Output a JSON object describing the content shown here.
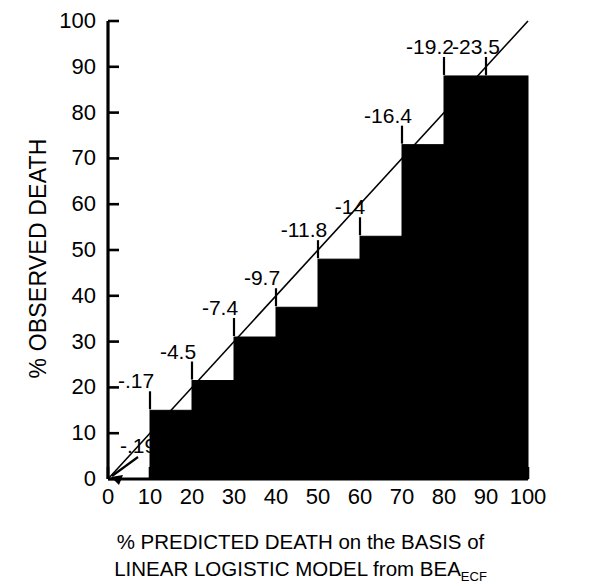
{
  "chart_data": {
    "type": "bar",
    "title": "",
    "xlabel_line1": "% PREDICTED DEATH on the BASIS of",
    "xlabel_line2_pre": "LINEAR LOGISTIC MODEL from BEA",
    "xlabel_line2_sub": "ECF",
    "ylabel": "% OBSERVED DEATH",
    "xlim": [
      0,
      100
    ],
    "ylim": [
      0,
      100
    ],
    "grid": false,
    "legend": false,
    "xticks": [
      "0",
      "10",
      "20",
      "30",
      "40",
      "50",
      "60",
      "70",
      "80",
      "90",
      "100"
    ],
    "yticks": [
      "0",
      "10",
      "20",
      "30",
      "40",
      "50",
      "60",
      "70",
      "80",
      "90",
      "100"
    ],
    "xtick_values": [
      0,
      10,
      20,
      30,
      40,
      50,
      60,
      70,
      80,
      90,
      100
    ],
    "ytick_values": [
      0,
      10,
      20,
      30,
      40,
      50,
      60,
      70,
      80,
      90,
      100
    ],
    "categories": [
      "0-10",
      "10-20",
      "20-30",
      "30-40",
      "40-50",
      "50-60",
      "60-70",
      "70-80",
      "80-90",
      "90-100"
    ],
    "bin_starts": [
      0,
      10,
      20,
      30,
      40,
      50,
      60,
      70,
      80,
      90
    ],
    "bin_ends": [
      10,
      20,
      30,
      40,
      50,
      60,
      70,
      80,
      90,
      100
    ],
    "values": [
      0,
      15,
      21.5,
      31,
      37.5,
      48,
      53,
      73,
      88,
      88
    ],
    "point_labels": [
      "-.19",
      "-.17",
      "-4.5",
      "-7.4",
      "-9.7",
      "-11.8",
      "-14",
      "-16.4",
      "-19.2",
      "-23.5"
    ],
    "point_label_x": [
      0,
      10,
      20,
      30,
      40,
      50,
      60,
      70,
      80,
      90
    ],
    "reference_line": {
      "name": "identity line",
      "from": [
        0,
        0
      ],
      "to": [
        100,
        100
      ]
    },
    "bar_color": "#000000",
    "axis_color": "#000000",
    "background_color": "#ffffff"
  }
}
